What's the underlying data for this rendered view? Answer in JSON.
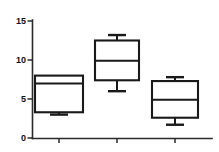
{
  "chart_data": {
    "type": "box",
    "title": "",
    "xlabel": "",
    "ylabel": "",
    "ylim": [
      0,
      15
    ],
    "xlim": [
      0,
      3
    ],
    "grid": false,
    "legend": null,
    "y_ticks": [
      0,
      5,
      10,
      15
    ],
    "y_tick_labels": [
      "0",
      "5",
      "10",
      "15"
    ],
    "x_ticks": [
      1,
      2,
      3
    ],
    "x_tick_labels": [
      "",
      "",
      ""
    ],
    "categories": [
      "1",
      "2",
      "3"
    ],
    "boxes": [
      {
        "category": "1",
        "whisker_low": 3.0,
        "q1": 3.3,
        "median": 7.0,
        "q3": 8.0,
        "whisker_high": 8.0,
        "has_upper_cap": false,
        "has_lower_cap": true
      },
      {
        "category": "2",
        "whisker_low": 6.0,
        "q1": 7.4,
        "median": 9.9,
        "q3": 12.5,
        "whisker_high": 13.2,
        "has_upper_cap": true,
        "has_lower_cap": true
      },
      {
        "category": "3",
        "whisker_low": 1.7,
        "q1": 2.6,
        "median": 4.9,
        "q3": 7.3,
        "whisker_high": 7.8,
        "has_upper_cap": true,
        "has_lower_cap": true
      }
    ],
    "colors": {
      "box_stroke": "#1a1a1a",
      "box_fill": "#ffffff",
      "axis": "#2b2b2b",
      "text": "#111111",
      "background": "#ffffff"
    }
  }
}
